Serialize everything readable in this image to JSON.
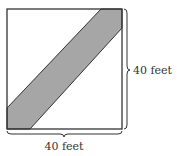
{
  "diagram": {
    "type": "square-with-diagonal-strip",
    "side_label_right": "40 feet",
    "side_label_bottom": "40 feet",
    "colors": {
      "outline": "#333333",
      "strip_fill": "#a6a6a6",
      "background": "#ffffff"
    }
  }
}
